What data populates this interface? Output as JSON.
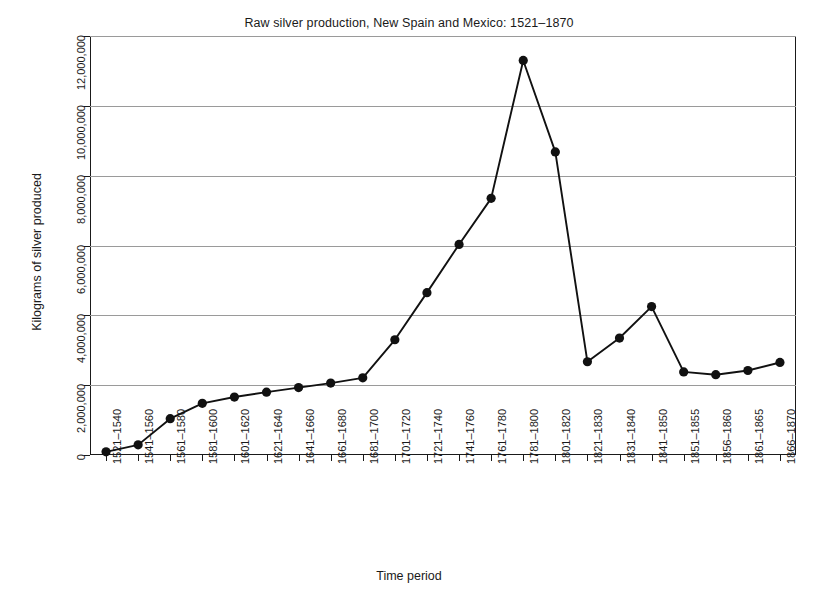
{
  "chart_data": {
    "type": "line",
    "title": "Raw silver production, New Spain and Mexico: 1521–1870",
    "xlabel": "Time period",
    "ylabel": "Kilograms of silver produced",
    "grid": "horizontal",
    "legend": "none",
    "marker": "filled-circle",
    "line_color": "#111111",
    "marker_color": "#111111",
    "grid_color": "#9a9a9a",
    "axis_color": "#1a1a1a",
    "ylim": [
      0,
      12000000
    ],
    "yticks": [
      0,
      2000000,
      4000000,
      6000000,
      8000000,
      10000000,
      12000000
    ],
    "ytick_labels": [
      "0",
      "2,000,000",
      "4,000,000",
      "6,000,000",
      "8,000,000",
      "10,000,000",
      "12,000,000"
    ],
    "categories": [
      "1521–1540",
      "1541–1560",
      "1561–1580",
      "1581–1600",
      "1601–1620",
      "1621–1640",
      "1641–1660",
      "1661–1680",
      "1681–1700",
      "1701–1720",
      "1721–1740",
      "1741–1760",
      "1761–1780",
      "1781–1800",
      "1801–1820",
      "1821–1830",
      "1831–1840",
      "1841–1850",
      "1851–1855",
      "1856–1860",
      "1861–1865",
      "1866–1870"
    ],
    "values": [
      90000,
      290000,
      1040000,
      1480000,
      1660000,
      1800000,
      1930000,
      2060000,
      2210000,
      3300000,
      4650000,
      6030000,
      7350000,
      11300000,
      8680000,
      2670000,
      3350000,
      4250000,
      2380000,
      2300000,
      2420000,
      2650000
    ]
  }
}
